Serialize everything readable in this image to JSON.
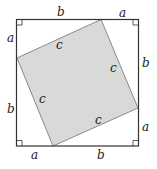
{
  "diagram": {
    "colors": {
      "outline": "#333333",
      "inner_fill": "#d9d9d9",
      "inner_stroke": "#8a8a8a"
    },
    "labels": {
      "top_b": "b",
      "top_a": "a",
      "right_b": "b",
      "right_a": "a",
      "bottom_a": "a",
      "bottom_b": "b",
      "left_a": "a",
      "left_b": "b",
      "c_top": "c",
      "c_right": "c",
      "c_left": "c",
      "c_bottom": "c"
    }
  }
}
